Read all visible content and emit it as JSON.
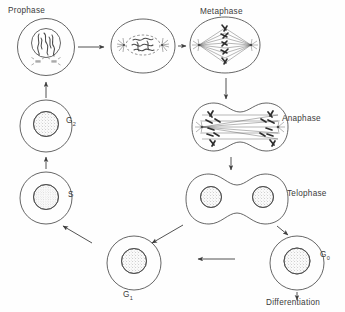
{
  "figure": {
    "kind": "cell-cycle-diagram",
    "background_color": "#fefefe",
    "line_color": "#4a4a4a",
    "text_color": "#3b3b3b"
  },
  "labels": {
    "prophase": "Prophase",
    "metaphase": "Metaphase",
    "anaphase": "Anaphase",
    "telophase": "Telophase",
    "g2": "G",
    "g2_sub": "2",
    "s": "S",
    "g1": "G",
    "g1_sub": "1",
    "g0": "G",
    "g0_sub": "0",
    "differentiation": "Differentiation"
  },
  "stages": [
    {
      "name": "prophase-early",
      "shape": "circle",
      "nucleus": "condensed-chromosomes",
      "label": "Prophase"
    },
    {
      "name": "prophase-late",
      "shape": "oval",
      "nucleus": "chromosomes-with-centrosomes",
      "label": ""
    },
    {
      "name": "metaphase",
      "shape": "oval",
      "nucleus": "spindle-equatorial-plate",
      "label": "Metaphase"
    },
    {
      "name": "anaphase",
      "shape": "dumbbell",
      "nucleus": "chromosomes-to-poles",
      "label": "Anaphase"
    },
    {
      "name": "telophase",
      "shape": "dumbbell",
      "nucleus": "two-reformed-nuclei",
      "label": "Telophase"
    },
    {
      "name": "g0",
      "shape": "circle",
      "nucleus": "stippled",
      "label": "G0"
    },
    {
      "name": "g1",
      "shape": "circle",
      "nucleus": "stippled",
      "label": "G1"
    },
    {
      "name": "s",
      "shape": "circle",
      "nucleus": "stippled",
      "label": "S"
    },
    {
      "name": "g2",
      "shape": "circle",
      "nucleus": "stippled",
      "label": "G2"
    }
  ],
  "arrows": [
    {
      "from": "prophase-early",
      "to": "prophase-late",
      "direction": "right"
    },
    {
      "from": "prophase-late",
      "to": "metaphase",
      "direction": "right"
    },
    {
      "from": "metaphase",
      "to": "anaphase",
      "direction": "down"
    },
    {
      "from": "anaphase",
      "to": "telophase",
      "direction": "down"
    },
    {
      "from": "telophase",
      "to": "g1",
      "direction": "down-left"
    },
    {
      "from": "telophase",
      "to": "g0",
      "direction": "down-right"
    },
    {
      "from": "g0",
      "to": "differentiation",
      "direction": "down"
    },
    {
      "from": "g0",
      "to": "g1",
      "direction": "left"
    },
    {
      "from": "g1",
      "to": "s",
      "direction": "up-left"
    },
    {
      "from": "s",
      "to": "g2",
      "direction": "up"
    },
    {
      "from": "g2",
      "to": "prophase-early",
      "direction": "up"
    }
  ]
}
